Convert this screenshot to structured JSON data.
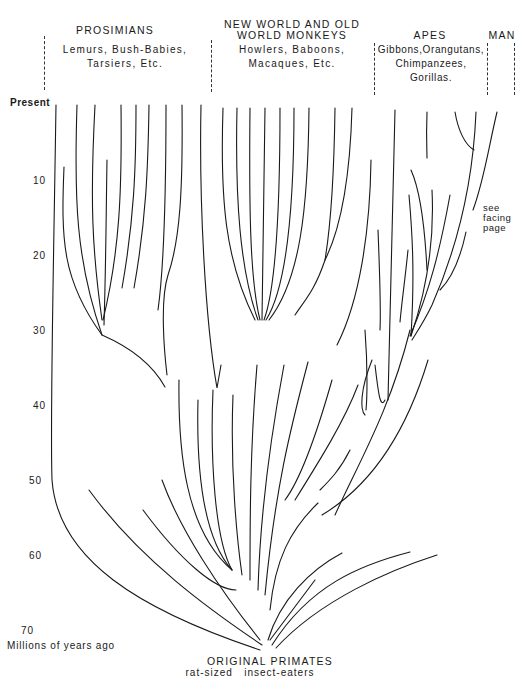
{
  "groups": [
    {
      "title": "PROSIMIANS",
      "examples_line1": "Lemurs, Bush-Babies,",
      "examples_line2": "Tarsiers, Etc."
    },
    {
      "title_line1": "NEW WORLD AND OLD",
      "title_line2": "WORLD MONKEYS",
      "examples_line1": "Howlers, Baboons,",
      "examples_line2": "Macaques, Etc."
    },
    {
      "title": "APES",
      "examples_line1": "Gibbons,Orangutans,",
      "examples_line2": "Chimpanzees,",
      "examples_line3": "Gorillas."
    },
    {
      "title": "MAN"
    }
  ],
  "time_axis": {
    "ticks": [
      "Present",
      "10",
      "20",
      "30",
      "40",
      "50",
      "60",
      "70"
    ],
    "label": "Millions of years ago"
  },
  "note": {
    "line1": "see",
    "line2": "facing",
    "line3": "page"
  },
  "root": {
    "title": "ORIGINAL PRIMATES",
    "subtitle": "rat-sized   insect-eaters"
  }
}
